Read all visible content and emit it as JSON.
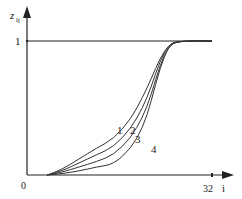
{
  "chart_data": {
    "type": "line",
    "title": "",
    "xlabel": "i",
    "ylabel": "z_ij",
    "xlim": [
      0,
      32
    ],
    "ylim": [
      0,
      1
    ],
    "x_ticks": [
      "0",
      "32"
    ],
    "y_ticks": [
      "1"
    ],
    "grid": false,
    "legend": "inline curve labels",
    "reference_line": {
      "y": 1,
      "label": "1"
    },
    "series": [
      {
        "name": "1",
        "x": [
          3.5,
          6,
          9,
          12,
          15,
          18,
          20,
          21.5,
          23,
          24.5,
          26,
          32
        ],
        "values": [
          0.0,
          0.04,
          0.12,
          0.2,
          0.27,
          0.42,
          0.58,
          0.72,
          0.87,
          0.97,
          1.0,
          1.0
        ]
      },
      {
        "name": "2",
        "x": [
          3.5,
          6,
          9,
          12,
          15,
          18,
          20,
          21.5,
          23,
          24.5,
          26,
          32
        ],
        "values": [
          0.0,
          0.03,
          0.09,
          0.15,
          0.21,
          0.35,
          0.5,
          0.66,
          0.85,
          0.97,
          1.0,
          1.0
        ]
      },
      {
        "name": "3",
        "x": [
          3.5,
          6,
          9,
          12,
          15,
          18,
          20,
          21.5,
          23,
          24.5,
          26,
          32
        ],
        "values": [
          0.0,
          0.02,
          0.06,
          0.1,
          0.15,
          0.28,
          0.43,
          0.6,
          0.82,
          0.96,
          1.0,
          1.0
        ]
      },
      {
        "name": "4",
        "x": [
          3.5,
          6,
          9,
          12,
          15,
          18,
          20,
          21.5,
          23,
          24.5,
          26,
          32
        ],
        "values": [
          0.0,
          0.01,
          0.03,
          0.06,
          0.08,
          0.2,
          0.35,
          0.55,
          0.8,
          0.96,
          1.0,
          1.0
        ]
      }
    ]
  },
  "labels": {
    "y_axis": "z",
    "y_axis_sub": "ij",
    "x_axis": "i",
    "origin": "0",
    "x_max": "32",
    "y_one": "1",
    "curve_1": "1",
    "curve_2": "2",
    "curve_3": "3",
    "curve_4": "4"
  }
}
